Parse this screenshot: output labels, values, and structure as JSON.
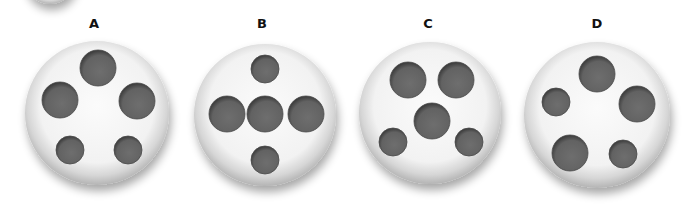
{
  "figure": {
    "colors": {
      "background": "#ffffff",
      "plate": "#f4f4f4",
      "plate_edge": "#bdbdbd",
      "hole": "#666666",
      "hole_shadow": "#3a3a3a",
      "label": "#111111"
    },
    "options": [
      {
        "label": "A",
        "holes": [
          {
            "position": "top",
            "size": "large"
          },
          {
            "position": "upper-left",
            "size": "large"
          },
          {
            "position": "upper-right",
            "size": "large"
          },
          {
            "position": "lower-left",
            "size": "small"
          },
          {
            "position": "lower-right",
            "size": "small"
          }
        ]
      },
      {
        "label": "B",
        "holes": [
          {
            "position": "top",
            "size": "small"
          },
          {
            "position": "middle-left",
            "size": "large"
          },
          {
            "position": "center",
            "size": "large"
          },
          {
            "position": "middle-right",
            "size": "large"
          },
          {
            "position": "bottom",
            "size": "small"
          }
        ]
      },
      {
        "label": "C",
        "holes": [
          {
            "position": "upper-left",
            "size": "large"
          },
          {
            "position": "upper-right",
            "size": "large"
          },
          {
            "position": "center",
            "size": "large"
          },
          {
            "position": "lower-left",
            "size": "small"
          },
          {
            "position": "lower-right",
            "size": "small"
          }
        ]
      },
      {
        "label": "D",
        "holes": [
          {
            "position": "top",
            "size": "large"
          },
          {
            "position": "left",
            "size": "small"
          },
          {
            "position": "right",
            "size": "large"
          },
          {
            "position": "lower-left",
            "size": "large"
          },
          {
            "position": "lower-right",
            "size": "small"
          }
        ]
      }
    ]
  }
}
